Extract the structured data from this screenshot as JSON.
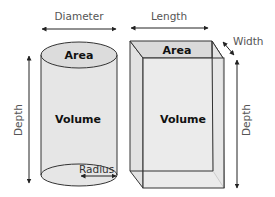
{
  "diagram": {
    "cylinder": {
      "top_label": "Area",
      "body_label": "Volume",
      "dimension_top": "Diameter",
      "dimension_side": "Depth",
      "dimension_bottom": "Radius"
    },
    "box": {
      "top_label": "Area",
      "body_label": "Volume",
      "dimension_top": "Length",
      "dimension_corner": "Width",
      "dimension_side": "Depth"
    },
    "colors": {
      "fill": "#e6e6e6",
      "fill_top": "#dadada",
      "stroke": "#333333",
      "label_text": "#555555",
      "bold_text": "#111111"
    }
  }
}
